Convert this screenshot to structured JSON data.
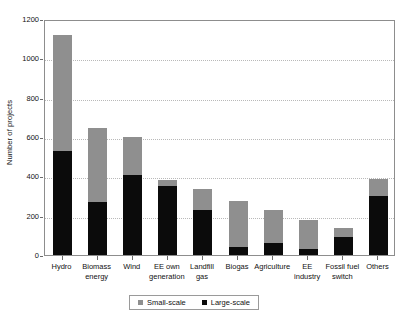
{
  "chart_data": {
    "type": "bar",
    "subtype": "stacked",
    "title": "",
    "xlabel": "",
    "ylabel": "Number of projects",
    "ylim": [
      0,
      1200
    ],
    "ytick_values": [
      0,
      200,
      400,
      600,
      800,
      1000,
      1200
    ],
    "ytick_labels": [
      "0",
      "200",
      "400",
      "600",
      "800",
      "1000",
      "1200"
    ],
    "grid": true,
    "grid_axis": "y",
    "legend_position": "bottom-center",
    "categories": [
      "Hydro",
      "Biomass\nenergy",
      "Wind",
      "EE own\ngeneration",
      "Landfill\ngas",
      "Biogas",
      "Agriculture",
      "EE\nindustry",
      "Fossil fuel\nswitch",
      "Others"
    ],
    "series": [
      {
        "name": "Large-scale",
        "color": "#0b0b0b",
        "values": [
          527,
          270,
          405,
          350,
          228,
          42,
          62,
          30,
          90,
          300
        ]
      },
      {
        "name": "Small-scale",
        "color": "#8f8f8f",
        "values": [
          593,
          375,
          197,
          30,
          110,
          233,
          168,
          148,
          47,
          87
        ]
      }
    ],
    "totals": [
      1120,
      645,
      602,
      380,
      338,
      275,
      230,
      178,
      137,
      387
    ]
  },
  "legend": {
    "entries": [
      {
        "label": "Small-scale",
        "color": "#8f8f8f"
      },
      {
        "label": "Large-scale",
        "color": "#0b0b0b"
      }
    ]
  },
  "axis": {
    "y_title": "Number of projects"
  }
}
